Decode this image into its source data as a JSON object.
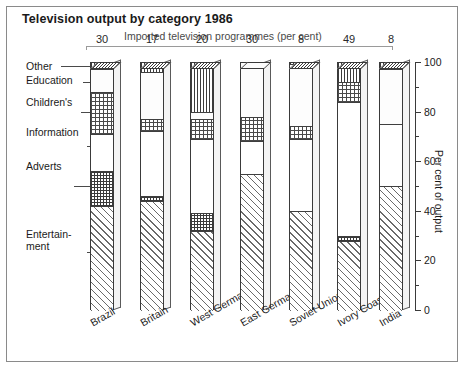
{
  "title": "Television output by category 1986",
  "imported": {
    "caption": "Imported television programmes (per cent)",
    "values": [
      "30",
      "17",
      "20",
      "30",
      "8",
      "49",
      "8"
    ]
  },
  "axis": {
    "title": "Per cent of output",
    "ticks": [
      "0",
      "20",
      "40",
      "60",
      "80",
      "100"
    ],
    "min": 0,
    "max": 100
  },
  "categories": [
    {
      "label": "Other"
    },
    {
      "label": "Education"
    },
    {
      "label": "Children's"
    },
    {
      "label": "Information"
    },
    {
      "label": "Adverts"
    },
    {
      "label": "Entertain-"
    },
    {
      "label": "ment"
    }
  ],
  "chart_data": {
    "type": "bar",
    "subtype": "stacked-100-percent-3d",
    "title": "Television output by category 1986",
    "xlabel": "",
    "ylabel": "Per cent of output",
    "ylim": [
      0,
      100
    ],
    "grid": false,
    "legend_position": "left-annotations",
    "categories": [
      "Brazil",
      "Britain",
      "West Germany",
      "East Germany",
      "Soviet Union",
      "Ivory Coast",
      "India"
    ],
    "stack_order_top_to_bottom": [
      "Other",
      "Education",
      "Children's",
      "Information",
      "Adverts",
      "Entertainment"
    ],
    "series": [
      {
        "name": "Other",
        "values": [
          3,
          4,
          20,
          0,
          1,
          8,
          3
        ]
      },
      {
        "name": "Education",
        "values": [
          9,
          19,
          3,
          22,
          25,
          0,
          22
        ]
      },
      {
        "name": "Children's",
        "values": [
          17,
          5,
          8,
          10,
          5,
          8,
          0
        ]
      },
      {
        "name": "Information",
        "values": [
          15,
          26,
          30,
          13,
          29,
          54,
          25
        ]
      },
      {
        "name": "Adverts",
        "values": [
          14,
          2,
          7,
          0,
          0,
          2,
          0
        ]
      },
      {
        "name": "Entertainment",
        "values": [
          42,
          44,
          32,
          55,
          40,
          28,
          50
        ]
      }
    ],
    "annotation_row": {
      "label": "Imported television programmes (per cent)",
      "values": [
        30,
        17,
        20,
        30,
        8,
        49,
        8
      ]
    }
  }
}
